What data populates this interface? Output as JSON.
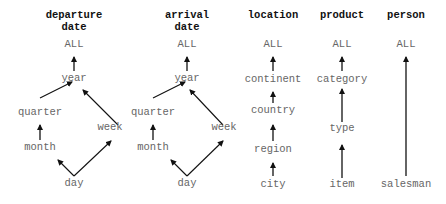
{
  "diagram": {
    "type": "concept-hierarchies",
    "dimensions": [
      {
        "id": "departure",
        "header_line1": "departure",
        "header_line2": "date",
        "nodes": {
          "all": "ALL",
          "year": "year",
          "quarter": "quarter",
          "week": "week",
          "month": "month",
          "day": "day"
        },
        "edges": [
          [
            "year",
            "ALL"
          ],
          [
            "quarter",
            "year"
          ],
          [
            "week",
            "year"
          ],
          [
            "month",
            "quarter"
          ],
          [
            "day",
            "month"
          ],
          [
            "day",
            "week"
          ]
        ]
      },
      {
        "id": "arrival",
        "header_line1": "arrival",
        "header_line2": "date",
        "nodes": {
          "all": "ALL",
          "year": "year",
          "quarter": "quarter",
          "week": "week",
          "month": "month",
          "day": "day"
        },
        "edges": [
          [
            "year",
            "ALL"
          ],
          [
            "quarter",
            "year"
          ],
          [
            "week",
            "year"
          ],
          [
            "month",
            "quarter"
          ],
          [
            "day",
            "month"
          ],
          [
            "day",
            "week"
          ]
        ]
      },
      {
        "id": "location",
        "header_line1": "location",
        "nodes": {
          "all": "ALL",
          "continent": "continent",
          "country": "country",
          "region": "region",
          "city": "city"
        },
        "edges": [
          [
            "continent",
            "ALL"
          ],
          [
            "country",
            "continent"
          ],
          [
            "region",
            "country"
          ],
          [
            "city",
            "region"
          ]
        ]
      },
      {
        "id": "product",
        "header_line1": "product",
        "nodes": {
          "all": "ALL",
          "category": "category",
          "type": "type",
          "item": "item"
        },
        "edges": [
          [
            "category",
            "ALL"
          ],
          [
            "type",
            "category"
          ],
          [
            "item",
            "type"
          ]
        ]
      },
      {
        "id": "person",
        "header_line1": "person",
        "nodes": {
          "all": "ALL",
          "salesman": "salesman"
        },
        "edges": [
          [
            "salesman",
            "ALL"
          ]
        ]
      }
    ],
    "colors": {
      "header": "#111111",
      "node": "#666666",
      "edge": "#111111"
    }
  }
}
